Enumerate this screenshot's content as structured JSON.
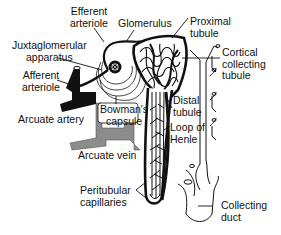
{
  "diagram": {
    "labels": {
      "efferent_arteriole": [
        "Efferent",
        "arteriole"
      ],
      "glomerulus": [
        "Glomerulus"
      ],
      "proximal_tubule": [
        "Proximal",
        "tubule"
      ],
      "juxtaglomerular_apparatus": [
        "Juxtaglomerular",
        "apparatus"
      ],
      "cortical_collecting_tubule": [
        "Cortical",
        "collecting",
        "tubule"
      ],
      "afferent_arteriole": [
        "Afferent",
        "arteriole"
      ],
      "bowmans_capsule": [
        "Bowman's",
        "capsule"
      ],
      "distal_tubule": [
        "Distal",
        "tubule"
      ],
      "arcuate_artery": [
        "Arcuate artery"
      ],
      "loop_of_henle": [
        "Loop of",
        "Henle"
      ],
      "arcuate_vein": [
        "Arcuate vein"
      ],
      "peritubular_capillaries": [
        "Peritubular",
        "capillaries"
      ],
      "collecting_duct": [
        "Collecting",
        "duct"
      ]
    },
    "colors": {
      "ink": "#111111",
      "vein_gray": "#8a8a8a",
      "background": "#ffffff"
    }
  }
}
